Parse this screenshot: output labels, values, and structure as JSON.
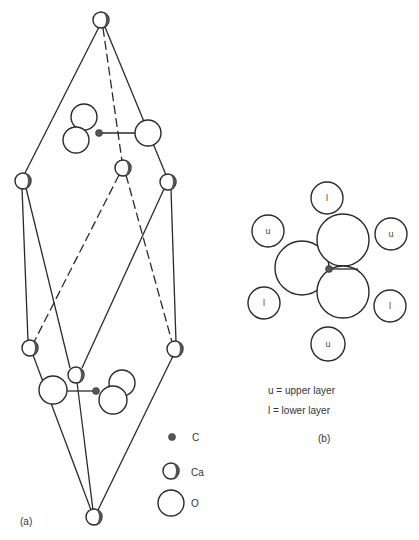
{
  "figure": {
    "panel_a": {
      "label": "(a)",
      "legend": [
        {
          "symbol": "carbon",
          "label": "C"
        },
        {
          "symbol": "calcium",
          "label": "Ca"
        },
        {
          "symbol": "oxygen",
          "label": "O"
        }
      ]
    },
    "panel_b": {
      "label": "(b)",
      "surrounding_atoms": [
        "l",
        "u",
        "u",
        "l",
        "l",
        "u"
      ],
      "key": [
        "u = upper layer",
        "l = lower layer"
      ]
    }
  }
}
